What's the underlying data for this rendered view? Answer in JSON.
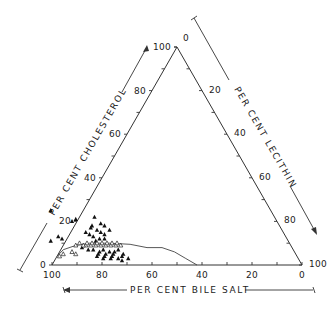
{
  "chart_data": {
    "type": "ternary-scatter",
    "title": "",
    "axes": {
      "cholesterol": {
        "label": "PER CENT CHOLESTEROL",
        "ticks": [
          "0",
          "20",
          "40",
          "60",
          "80",
          "100"
        ],
        "direction": "increases upward along left edge"
      },
      "lecithin": {
        "label": "PER CENT LECITHIN",
        "ticks": [
          "0",
          "20",
          "40",
          "60",
          "80",
          "100"
        ],
        "direction": "increases downward along right edge"
      },
      "bile_salt": {
        "label": "PER CENT BILE SALT",
        "ticks": [
          "100",
          "80",
          "60",
          "40",
          "20",
          "0"
        ],
        "direction": "increases leftward along bottom edge"
      }
    },
    "vertices": {
      "top": "100% cholesterol",
      "bottom_left": "100% bile salt",
      "bottom_right": "100% lecithin"
    },
    "micellar_limit_curve": {
      "description": "solubility boundary line",
      "points_bs_ch": [
        [
          96,
          4
        ],
        [
          92,
          7
        ],
        [
          86,
          9
        ],
        [
          80,
          10
        ],
        [
          72,
          10
        ],
        [
          64,
          9.5
        ],
        [
          58,
          8
        ],
        [
          52,
          8
        ],
        [
          48,
          6
        ],
        [
          45,
          3
        ],
        [
          42,
          0
        ]
      ]
    },
    "series": [
      {
        "name": "filled-triangles",
        "marker": "filled triangle",
        "approx_region": "bile salt 70-90%, cholesterol 3-22%",
        "points_bs_ch": [
          [
            91,
            13
          ],
          [
            90,
            12
          ],
          [
            95,
            11
          ],
          [
            84,
            8
          ],
          [
            82,
            20
          ],
          [
            80,
            21
          ],
          [
            79,
            15
          ],
          [
            78,
            14
          ],
          [
            77,
            13
          ],
          [
            76,
            17
          ],
          [
            75,
            18
          ],
          [
            74,
            16
          ],
          [
            73,
            15
          ],
          [
            72,
            14
          ],
          [
            71,
            19
          ],
          [
            70,
            18
          ],
          [
            69,
            16
          ],
          [
            72,
            22
          ],
          [
            73,
            12
          ],
          [
            75,
            12
          ],
          [
            77,
            11
          ],
          [
            80,
            4
          ],
          [
            79,
            5
          ],
          [
            78,
            3
          ],
          [
            77,
            4
          ],
          [
            76,
            5
          ],
          [
            75,
            3
          ],
          [
            74,
            4
          ],
          [
            73,
            5
          ],
          [
            72,
            3
          ],
          [
            71,
            2
          ],
          [
            70,
            4
          ],
          [
            69,
            5
          ],
          [
            68,
            3
          ],
          [
            80,
            7
          ],
          [
            78,
            6
          ],
          [
            76,
            7
          ],
          [
            74,
            6
          ],
          [
            72,
            6
          ],
          [
            70,
            7
          ],
          [
            88,
            25
          ],
          [
            82,
            7
          ]
        ]
      },
      {
        "name": "open-triangles",
        "marker": "open triangle",
        "approx_region": "along micellar line, bile salt 70-95%, cholesterol 5-10%",
        "points_bs_ch": [
          [
            95,
            4
          ],
          [
            93,
            5
          ],
          [
            88,
            5
          ],
          [
            86,
            9
          ],
          [
            84,
            10
          ],
          [
            82,
            9
          ],
          [
            81,
            10
          ],
          [
            80,
            9
          ],
          [
            79,
            10
          ],
          [
            78,
            9
          ],
          [
            77,
            10
          ],
          [
            76,
            9
          ],
          [
            75,
            10
          ],
          [
            74,
            9
          ],
          [
            73,
            10
          ],
          [
            72,
            9
          ],
          [
            71,
            10
          ],
          [
            70,
            9
          ],
          [
            69,
            10
          ],
          [
            68,
            9
          ],
          [
            89,
            6
          ],
          [
            83,
            9
          ]
        ]
      }
    ],
    "grid": false,
    "legend": null
  }
}
